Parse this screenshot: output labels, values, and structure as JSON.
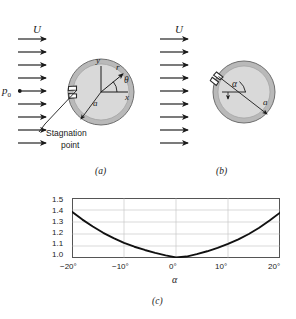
{
  "figure": {
    "panels": [
      {
        "id": "a",
        "caption": "(a)",
        "flow_label": "U",
        "pressure_label": "p0",
        "pressure_label_sub": "0",
        "arrow_count": 9,
        "annotations": {
          "y_axis": "y",
          "x_axis": "x",
          "radius_vector": "r",
          "angle": "θ",
          "radius": "a",
          "stagnation_line1": "Stagnation",
          "stagnation_line2": "point"
        }
      },
      {
        "id": "b",
        "caption": "(b)",
        "flow_label": "U",
        "arrow_count": 9,
        "annotations": {
          "angle": "α",
          "radius": "a"
        }
      },
      {
        "id": "c",
        "caption": "(c)"
      }
    ],
    "colors": {
      "ring_fill": "#b9b9b9",
      "disk_fill": "#d9d9d9",
      "outline": "#6f6f6f",
      "ink": "#1a1a1a",
      "grid": "#c9c9c9",
      "axis": "#555555",
      "curve": "#111111",
      "background": "#ffffff"
    }
  },
  "chart_data": {
    "type": "line",
    "title": "",
    "xlabel": "α",
    "ylabel": "U/U'",
    "ylabel_numerator": "U",
    "ylabel_denominator": "U'",
    "xlim": [
      -20,
      20
    ],
    "ylim": [
      1.0,
      1.5
    ],
    "xticks": [
      -20,
      -10,
      0,
      10,
      20
    ],
    "xtick_labels": [
      "−20°",
      "−10°",
      "0°",
      "10°",
      "20°"
    ],
    "yticks": [
      1.0,
      1.1,
      1.2,
      1.3,
      1.4,
      1.5
    ],
    "ytick_labels": [
      "1.0",
      "1.1",
      "1.2",
      "1.3",
      "1.4",
      "1.5"
    ],
    "grid": true,
    "legend": null,
    "series": [
      {
        "name": "U/U' vs alpha",
        "x": [
          -20,
          -18,
          -16,
          -14,
          -12,
          -10,
          -8,
          -6,
          -4,
          -2,
          0,
          2,
          4,
          6,
          8,
          10,
          12,
          14,
          16,
          18,
          20
        ],
        "y": [
          1.385,
          1.32,
          1.262,
          1.21,
          1.165,
          1.126,
          1.094,
          1.067,
          1.043,
          1.022,
          1.005,
          1.012,
          1.032,
          1.056,
          1.084,
          1.117,
          1.155,
          1.2,
          1.252,
          1.312,
          1.378
        ]
      }
    ]
  }
}
